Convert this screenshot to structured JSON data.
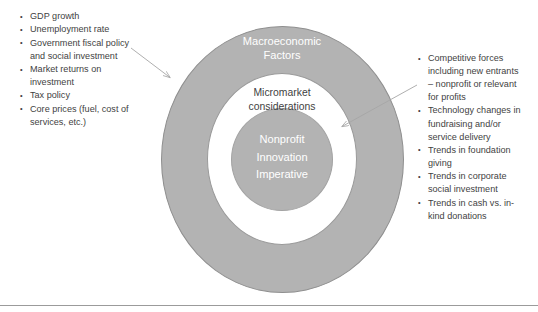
{
  "diagram": {
    "title_hidden": "",
    "rings": {
      "outer": {
        "label": "Macroeconomic\nFactors",
        "fill": "#b3b3b3",
        "text_color": "#ffffff"
      },
      "middle": {
        "label": "Micromarket\nconsiderations",
        "fill": "#ffffff",
        "text_color": "#3f3f3f"
      },
      "inner": {
        "label": "Nonprofit\nInnovation\nImperative",
        "fill": "#b3b3b3",
        "text_color": "#ffffff"
      }
    },
    "left_annotations": {
      "target": "outer-ring",
      "items": [
        "GDP growth",
        "Unemployment rate",
        "Government fiscal policy\nand social investment",
        "Market returns on\ninvestment",
        "Tax policy",
        "Core prices (fuel, cost of\nservices, etc.)"
      ]
    },
    "right_annotations": {
      "target": "middle-ring",
      "items": [
        "Competitive forces\nincluding new entrants\n– nonprofit or relevant\nfor profits",
        "Technology changes in\nfundraising and/or\nservice delivery",
        "Trends in foundation\ngiving",
        "Trends in corporate\nsocial investment",
        "Trends in cash vs. in-\nkind donations"
      ]
    },
    "arrows": [
      {
        "name": "left-arrow",
        "from": [
          131,
          48
        ],
        "to": [
          172,
          79
        ],
        "color": "#a6a6a6"
      },
      {
        "name": "right-arrow",
        "from": [
          417,
          85
        ],
        "to": [
          340,
          128
        ],
        "color": "#a6a6a6"
      }
    ],
    "colors": {
      "ring_fill": "#b3b3b3",
      "ring_stroke": "#8f8f8f",
      "text_dark": "#3f3f3f",
      "text_light": "#ffffff",
      "arrow": "#a6a6a6",
      "rule": "#9b9b9b"
    }
  }
}
